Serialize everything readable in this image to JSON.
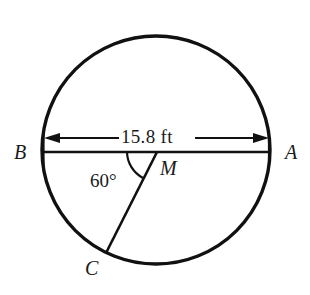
{
  "figure": {
    "type": "circle-geometry-diagram",
    "stroke_color": "#111111",
    "background_color": "#ffffff",
    "circle": {
      "name": "main-circle",
      "center_label": "M",
      "center_x": 156,
      "center_y": 150,
      "radius_px": 114,
      "stroke_width": 3.2
    },
    "points": [
      {
        "id": "B",
        "label": "B",
        "x": 42,
        "y": 151,
        "description": "left endpoint of diameter"
      },
      {
        "id": "A",
        "label": "A",
        "x": 270,
        "y": 151,
        "description": "right endpoint of diameter"
      },
      {
        "id": "M",
        "label": "M",
        "x": 156,
        "y": 151,
        "description": "center of circle"
      },
      {
        "id": "C",
        "label": "C",
        "x": 106,
        "y": 253,
        "description": "point on circle, end of radius MC"
      }
    ],
    "segments": [
      {
        "id": "diameter-BA",
        "from": "B",
        "to": "A",
        "stroke_width": 2.4
      },
      {
        "id": "radius-MC",
        "from": "M",
        "to": "C",
        "stroke_width": 2.4
      }
    ],
    "angle": {
      "name": "central-angle-BMC",
      "value": "60°",
      "vertex": "M",
      "from_ray": "MB",
      "to_ray": "MC",
      "arc_radius_px": 30
    },
    "dimension": {
      "name": "diameter-dimension",
      "value": "15.8 ft",
      "measure": "15.8",
      "unit": "ft",
      "from": "B",
      "to": "A",
      "line_y": 138,
      "arrow_style": "double-headed"
    }
  }
}
